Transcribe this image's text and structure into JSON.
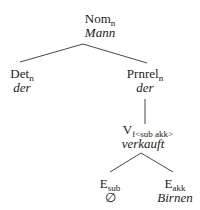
{
  "tree": {
    "root": {
      "category": "Nom",
      "subscript": "n",
      "word": "Mann",
      "children": [
        {
          "category": "Det",
          "subscript": "n",
          "word": "der"
        },
        {
          "category": "Prnrel",
          "subscript": "n",
          "word": "der",
          "children": [
            {
              "category": "V",
              "subscript": "f<sub akk>",
              "word": "verkauft",
              "children": [
                {
                  "category": "E",
                  "subscript": "sub",
                  "word": "∅"
                },
                {
                  "category": "E",
                  "subscript": "akk",
                  "word": "Birnen"
                }
              ]
            }
          ]
        }
      ]
    }
  }
}
